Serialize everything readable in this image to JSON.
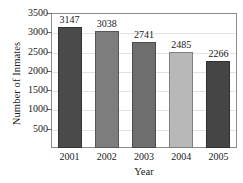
{
  "chart_data": {
    "type": "bar",
    "title": "",
    "xlabel": "Year",
    "ylabel": "Number of Inmates",
    "categories": [
      "2001",
      "2002",
      "2003",
      "2004",
      "2005"
    ],
    "values": [
      3147,
      3038,
      2741,
      2485,
      2266
    ],
    "value_labels": [
      "3147",
      "3038",
      "2741",
      "2485",
      "2266"
    ],
    "bar_colors": [
      "#4a4a4a",
      "#7d7d7d",
      "#6e6e6e",
      "#b8b8b8",
      "#454545"
    ],
    "ylim": [
      0,
      3500
    ],
    "yticks": [
      500,
      1000,
      1500,
      2000,
      2500,
      3000,
      3500
    ],
    "ytick_labels": [
      "500",
      "1000",
      "1500",
      "2000",
      "2500",
      "3000",
      "3500"
    ],
    "grid": true,
    "grid_color": "#e2e2e2",
    "legend": null,
    "frame_color": "#8c8c8c",
    "background": "#ffffff"
  }
}
